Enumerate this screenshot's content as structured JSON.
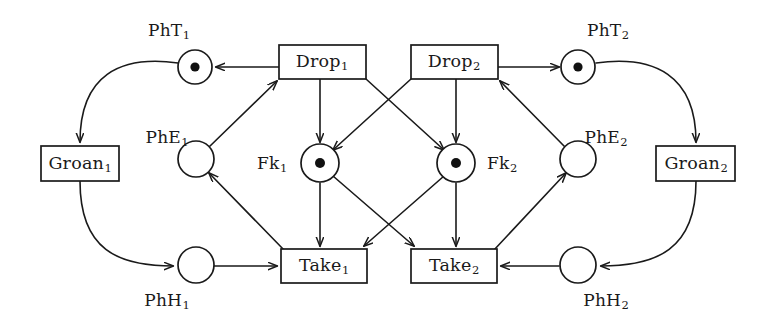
{
  "diagram": {
    "type": "petri-net",
    "background_color": "#ffffff",
    "stroke_color": "#1a1a1a",
    "token_color": "#111111"
  },
  "places": [
    {
      "id": "PhT1",
      "base": "PhT",
      "sub": "1",
      "label": "PhT1",
      "tokens": 1,
      "cx": 195,
      "cy": 67,
      "r": 17,
      "label_x": 169,
      "label_y": 30
    },
    {
      "id": "PhT2",
      "base": "PhT",
      "sub": "2",
      "label": "PhT2",
      "tokens": 1,
      "cx": 578,
      "cy": 67,
      "r": 17,
      "label_x": 608,
      "label_y": 30
    },
    {
      "id": "PhE1",
      "base": "PhE",
      "sub": "1",
      "label": "PhE1",
      "tokens": 0,
      "cx": 196,
      "cy": 159,
      "r": 18,
      "label_x": 167,
      "label_y": 137
    },
    {
      "id": "PhE2",
      "base": "PhE",
      "sub": "2",
      "label": "PhE2",
      "tokens": 0,
      "cx": 578,
      "cy": 159,
      "r": 18,
      "label_x": 606,
      "label_y": 137
    },
    {
      "id": "PhH1",
      "base": "PhH",
      "sub": "1",
      "label": "PhH1",
      "tokens": 0,
      "cx": 196,
      "cy": 265,
      "r": 18,
      "label_x": 167,
      "label_y": 300
    },
    {
      "id": "PhH2",
      "base": "PhH",
      "sub": "2",
      "label": "PhH2",
      "tokens": 0,
      "cx": 578,
      "cy": 265,
      "r": 18,
      "label_x": 606,
      "label_y": 300
    },
    {
      "id": "Fk1",
      "base": "Fk",
      "sub": "1",
      "label": "Fk1",
      "tokens": 1,
      "cx": 320,
      "cy": 163,
      "r": 19,
      "label_x": 272,
      "label_y": 163
    },
    {
      "id": "Fk2",
      "base": "Fk",
      "sub": "2",
      "label": "Fk2",
      "tokens": 1,
      "cx": 456,
      "cy": 163,
      "r": 19,
      "label_x": 502,
      "label_y": 163
    }
  ],
  "transitions": [
    {
      "id": "Drop1",
      "base": "Drop",
      "sub": "1",
      "label": "Drop1",
      "x": 279,
      "y": 45,
      "w": 87,
      "h": 34
    },
    {
      "id": "Drop2",
      "base": "Drop",
      "sub": "2",
      "label": "Drop2",
      "x": 411,
      "y": 45,
      "w": 87,
      "h": 34
    },
    {
      "id": "Take1",
      "base": "Take",
      "sub": "1",
      "label": "Take1",
      "x": 281,
      "y": 249,
      "w": 86,
      "h": 34
    },
    {
      "id": "Take2",
      "base": "Take",
      "sub": "2",
      "label": "Take2",
      "x": 411,
      "y": 249,
      "w": 86,
      "h": 34
    },
    {
      "id": "Groan1",
      "base": "Groan",
      "sub": "1",
      "label": "Groan1",
      "x": 41,
      "y": 146,
      "w": 78,
      "h": 35
    },
    {
      "id": "Groan2",
      "base": "Groan",
      "sub": "2",
      "label": "Groan2",
      "x": 656,
      "y": 146,
      "w": 79,
      "h": 35
    }
  ],
  "arcs": [
    {
      "id": "drop1-to-pht1",
      "from": "Drop1",
      "to": "PhT1",
      "shape": "straight"
    },
    {
      "id": "pht1-to-groan1",
      "from": "PhT1",
      "to": "Groan1",
      "shape": "curve"
    },
    {
      "id": "groan1-to-phh1",
      "from": "Groan1",
      "to": "PhH1",
      "shape": "curve"
    },
    {
      "id": "phh1-to-take1",
      "from": "PhH1",
      "to": "Take1",
      "shape": "straight"
    },
    {
      "id": "phe1-to-drop1",
      "from": "PhE1",
      "to": "Drop1",
      "shape": "straight"
    },
    {
      "id": "take1-to-phe1",
      "from": "Take1",
      "to": "PhE1",
      "shape": "straight"
    },
    {
      "id": "drop1-to-fk1",
      "from": "Drop1",
      "to": "Fk1",
      "shape": "straight"
    },
    {
      "id": "drop1-to-fk2",
      "from": "Drop1",
      "to": "Fk2",
      "shape": "straight"
    },
    {
      "id": "fk1-to-take1",
      "from": "Fk1",
      "to": "Take1",
      "shape": "straight"
    },
    {
      "id": "fk1-to-take2",
      "from": "Fk1",
      "to": "Take2",
      "shape": "straight"
    },
    {
      "id": "drop2-to-pht2",
      "from": "Drop2",
      "to": "PhT2",
      "shape": "straight"
    },
    {
      "id": "pht2-to-groan2",
      "from": "PhT2",
      "to": "Groan2",
      "shape": "curve"
    },
    {
      "id": "groan2-to-phh2",
      "from": "Groan2",
      "to": "PhH2",
      "shape": "curve"
    },
    {
      "id": "phh2-to-take2",
      "from": "PhH2",
      "to": "Take2",
      "shape": "straight"
    },
    {
      "id": "phe2-to-drop2",
      "from": "PhE2",
      "to": "Drop2",
      "shape": "straight"
    },
    {
      "id": "take2-to-phe2",
      "from": "Take2",
      "to": "PhE2",
      "shape": "straight"
    },
    {
      "id": "drop2-to-fk2",
      "from": "Drop2",
      "to": "Fk2",
      "shape": "straight"
    },
    {
      "id": "drop2-to-fk1",
      "from": "Drop2",
      "to": "Fk1",
      "shape": "straight"
    },
    {
      "id": "fk2-to-take2",
      "from": "Fk2",
      "to": "Take2",
      "shape": "straight"
    },
    {
      "id": "fk2-to-take1",
      "from": "Fk2",
      "to": "Take1",
      "shape": "straight"
    }
  ]
}
